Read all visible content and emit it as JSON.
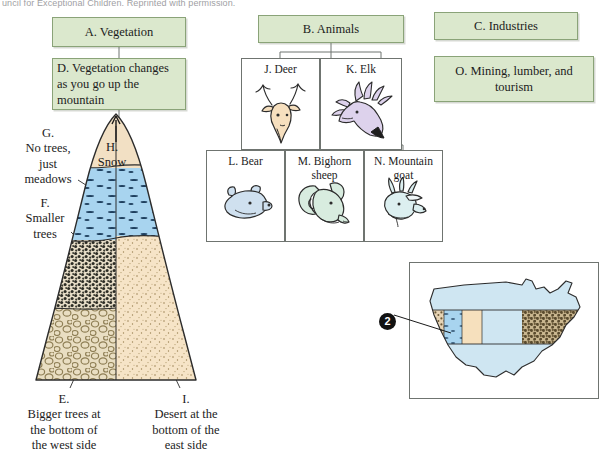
{
  "page": {
    "credit_line": "uncil for Exceptional Children. Reprinted with permission."
  },
  "boxes": {
    "a": {
      "label": "A. Vegetation"
    },
    "d": {
      "label": "D. Vegetation changes as you go up the mountain"
    },
    "b": {
      "label": "B. Animals"
    },
    "c": {
      "label": "C. Industries"
    },
    "o": {
      "label": "O. Mining, lumber, and tourism"
    }
  },
  "animals": [
    {
      "key": "j",
      "label": "J. Deer",
      "icon": "deer-head-icon"
    },
    {
      "key": "k",
      "label": "K. Elk",
      "icon": "elk-head-icon"
    },
    {
      "key": "l",
      "label": "L. Bear",
      "icon": "bear-head-icon"
    },
    {
      "key": "m",
      "label": "M. Bighorn sheep",
      "icon": "bighorn-sheep-head-icon"
    },
    {
      "key": "n",
      "label": "N. Mountain goat",
      "icon": "mountain-goat-head-icon"
    }
  ],
  "mountain": {
    "labels": {
      "g": "G.\nNo trees,\njust\nmeadows",
      "f": "F.\nSmaller\ntrees",
      "h": "H.\nSnow",
      "e": "E.\nBigger trees at\nthe bottom of\nthe west side",
      "i": "I.\nDesert at the\nbottom of the\neast side"
    },
    "bands": [
      {
        "name": "snow-cap",
        "color": "#f2e0c4"
      },
      {
        "name": "meadow-band",
        "color": "#a8d4ef"
      },
      {
        "name": "smaller-trees-west",
        "color": "#e8ddc7"
      },
      {
        "name": "desert-east",
        "color": "#f5e3c8"
      },
      {
        "name": "bigger-trees-west",
        "color": "#e5d9bd"
      }
    ]
  },
  "map": {
    "marker_number": "2",
    "land_color": "#cfe6f2",
    "bands": [
      {
        "name": "coastal-trees-band",
        "color": "#e6d3b4"
      },
      {
        "name": "mountain-meadow-band",
        "color": "#a8d4ef"
      },
      {
        "name": "desert-band",
        "color": "#f6e0bd"
      },
      {
        "name": "plains-band",
        "color": "#cfe6f2"
      },
      {
        "name": "eastern-forest-band",
        "color": "#8a7a5c"
      }
    ]
  },
  "colors": {
    "green_box_fill": "#dbe8cd",
    "green_box_border": "#8aa378",
    "outline": "#6f7470",
    "marker_fill": "#111111"
  }
}
